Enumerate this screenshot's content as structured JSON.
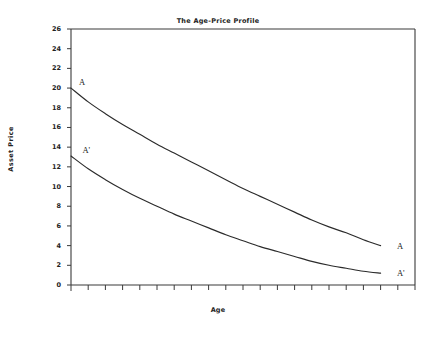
{
  "chart_data": {
    "type": "line",
    "title": "The Age-Price Profile",
    "xlabel": "Age",
    "ylabel": "Asset Price",
    "xlim": [
      0,
      20
    ],
    "ylim": [
      0,
      26
    ],
    "grid": false,
    "legend": "none",
    "y_ticks": [
      0,
      2,
      4,
      6,
      8,
      10,
      12,
      14,
      16,
      18,
      20,
      22,
      24,
      26
    ],
    "y_tick_labels": [
      "0",
      "2",
      "4",
      "6",
      "8",
      "10",
      "12",
      "14",
      "16",
      "18",
      "20",
      "22",
      "24",
      "26"
    ],
    "x_ticks": [
      0,
      1,
      2,
      3,
      4,
      5,
      6,
      7,
      8,
      9,
      10,
      11,
      12,
      13,
      14,
      15,
      16,
      17,
      18,
      19,
      20
    ],
    "x_tick_labels": [],
    "series": [
      {
        "name": "A",
        "start_label": "A",
        "end_label": "A",
        "x": [
          0,
          1,
          2,
          3,
          4,
          5,
          6,
          7,
          8,
          9,
          10,
          11,
          12,
          13,
          14,
          15,
          16,
          17,
          18
        ],
        "values": [
          20.0,
          18.6,
          17.4,
          16.3,
          15.3,
          14.3,
          13.4,
          12.5,
          11.6,
          10.7,
          9.8,
          9.0,
          8.2,
          7.4,
          6.6,
          5.9,
          5.3,
          4.6,
          4.0
        ]
      },
      {
        "name": "A'",
        "start_label": "A'",
        "end_label": "A'",
        "x": [
          0,
          1,
          2,
          3,
          4,
          5,
          6,
          7,
          8,
          9,
          10,
          11,
          12,
          13,
          14,
          15,
          16,
          17,
          18
        ],
        "values": [
          13.1,
          11.8,
          10.7,
          9.7,
          8.8,
          8.0,
          7.2,
          6.5,
          5.8,
          5.1,
          4.5,
          3.9,
          3.4,
          2.9,
          2.4,
          2.0,
          1.7,
          1.4,
          1.2
        ]
      }
    ],
    "annotations": [
      {
        "text": "A",
        "x": 0.35,
        "y": 20.6,
        "series": "A",
        "position": "start"
      },
      {
        "text": "A'",
        "x": 0.55,
        "y": 13.7,
        "series": "A'",
        "position": "start"
      },
      {
        "text": "A",
        "x": 18.6,
        "y": 4.0,
        "series": "A",
        "position": "end"
      },
      {
        "text": "A'",
        "x": 18.6,
        "y": 1.2,
        "series": "A'",
        "position": "end"
      }
    ],
    "colors": {
      "line": "#2b2b2b",
      "axis": "#3a3a3a",
      "background": "#ffffff",
      "text": "#222222"
    }
  }
}
